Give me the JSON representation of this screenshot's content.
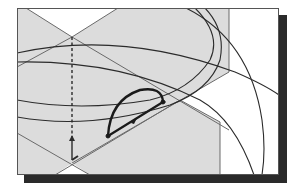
{
  "figure": {
    "colors": {
      "background": "#ffffff",
      "plane_fill": "#dcdcdc",
      "plane_edge": "#6a6a6a",
      "frame": "#555555",
      "shadow": "#2a2a2a",
      "curve": "#2b2b2b",
      "profile": "#1a1a1a"
    },
    "frame": {
      "x": 17,
      "y": 8,
      "width": 262,
      "height": 167,
      "shadow_offset": 7
    },
    "axis_line": {
      "x": 72,
      "y1": 37,
      "y2": 140,
      "style": "dashed"
    },
    "arrow": {
      "x": 72,
      "y_from": 160,
      "y_to": 136
    },
    "profile_arc": {
      "start": [
        108,
        136
      ],
      "end": [
        163,
        102
      ],
      "style": "bold"
    },
    "labels": []
  }
}
